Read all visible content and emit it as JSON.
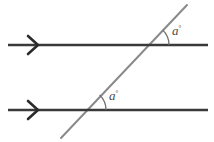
{
  "figure": {
    "background_color": "#ffffff",
    "width": 214,
    "height": 142
  },
  "colors": {
    "parallel_line": "#3a3a3a",
    "transversal": "#8a8a8a",
    "arc": "#6e6e6e",
    "label_text": "#4a4a4a",
    "marker": "#2b2b2b"
  },
  "parallel_lines": [
    {
      "id": "upper-parallel-line",
      "name": "upper parallel line",
      "x1": 8,
      "y1": 45,
      "x2": 208,
      "y2": 45,
      "marker": "single-chevron-right",
      "marker_x": 38
    },
    {
      "id": "lower-parallel-line",
      "name": "lower parallel line",
      "x1": 8,
      "y1": 110,
      "x2": 208,
      "y2": 110,
      "marker": "single-chevron-right",
      "marker_x": 38
    }
  ],
  "transversal": {
    "id": "transversal-line",
    "name": "transversal",
    "x1": 61,
    "y1": 138,
    "x2": 187,
    "y2": 5,
    "angle_degrees": 46
  },
  "intersections": [
    {
      "id": "upper-intersection",
      "x": 148,
      "y": 45
    },
    {
      "id": "lower-intersection",
      "x": 85,
      "y": 110
    }
  ],
  "angles": [
    {
      "id": "upper-angle",
      "name": "upper corresponding angle",
      "label": "a",
      "unit": "°",
      "label_x": 172,
      "label_y": 35,
      "vertex_x": 148,
      "vertex_y": 45,
      "arc_radius": 21,
      "arc_start_deg": 0,
      "arc_end_deg": 46
    },
    {
      "id": "lower-angle",
      "name": "lower corresponding angle",
      "label": "a",
      "unit": "°",
      "label_x": 109,
      "label_y": 100,
      "vertex_x": 85,
      "vertex_y": 110,
      "arc_radius": 21,
      "arc_start_deg": 0,
      "arc_end_deg": 46
    }
  ]
}
